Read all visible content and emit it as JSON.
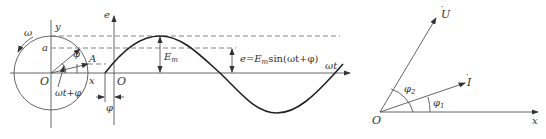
{
  "left_figure": {
    "labels": {
      "omega": "ω",
      "y_axis": "y",
      "a_point": "a",
      "phi": "φ",
      "A_point": "A",
      "origin_circle": "O",
      "x_axis": "x",
      "angle": "ωt+φ",
      "e_axis": "e",
      "origin_wave": "O",
      "phi_offset": "φ",
      "amplitude": "E",
      "amplitude_sub": "m",
      "time_axis": "ωt",
      "formula_prefix": "e=E",
      "formula_sub": "m",
      "formula_suffix": "sin(ωt+φ)"
    }
  },
  "right_figure": {
    "labels": {
      "U_vector": "U",
      "I_vector": "I",
      "phi2": "φ",
      "phi2_sub": "2",
      "phi1": "φ",
      "phi1_sub": "1",
      "origin": "O",
      "x_axis": "x"
    }
  }
}
